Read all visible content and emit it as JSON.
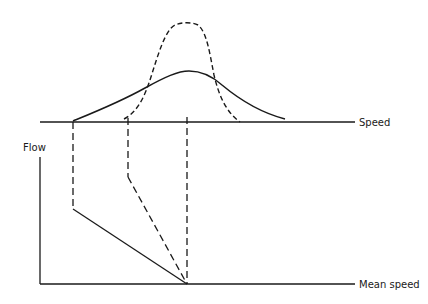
{
  "labels": {
    "speed_axis": "Speed",
    "flow_axis": "Flow",
    "mean_speed_axis": "Mean speed"
  },
  "colors": {
    "line": "#1a1a1a",
    "background": "#ffffff"
  },
  "diagram": {
    "upper_panel": "Speed distributions: solid (wide) and dashed (narrow) with same mean",
    "lower_panel": "Flow vs mean speed: solid and dashed lines converging at mean speed"
  }
}
